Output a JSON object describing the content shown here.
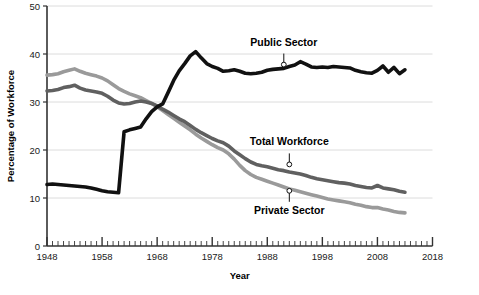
{
  "chart_data": {
    "type": "line",
    "title": "",
    "xlabel": "Year",
    "ylabel": "Percentage of Workforce",
    "xlim": [
      1948,
      2018
    ],
    "ylim": [
      0,
      50
    ],
    "xticks": [
      1948,
      1958,
      1968,
      1978,
      1988,
      1998,
      2008,
      2018
    ],
    "yticks": [
      0,
      10,
      20,
      30,
      40,
      50
    ],
    "xtick_labels": [
      "1948",
      "1958",
      "1968",
      "1978",
      "1988",
      "1998",
      "2008",
      "2018"
    ],
    "ytick_labels": [
      "0",
      "10",
      "20",
      "30",
      "40",
      "50"
    ],
    "minor_xtick_interval": 1,
    "grid": "horizontal",
    "grid_color": "#dcdcdc",
    "legend": "inline-annotations",
    "series": [
      {
        "name": "Public Sector",
        "color": "#111111",
        "label_position": "above",
        "label_anchor_x": 1991,
        "label_anchor_y": 37.8,
        "x": [
          1948,
          1949,
          1950,
          1951,
          1952,
          1953,
          1954,
          1955,
          1956,
          1957,
          1958,
          1959,
          1960,
          1961,
          1962,
          1963,
          1964,
          1965,
          1966,
          1967,
          1968,
          1969,
          1970,
          1971,
          1972,
          1973,
          1974,
          1975,
          1976,
          1977,
          1978,
          1979,
          1980,
          1981,
          1982,
          1983,
          1984,
          1985,
          1986,
          1987,
          1988,
          1989,
          1990,
          1991,
          1992,
          1993,
          1994,
          1995,
          1996,
          1997,
          1998,
          1999,
          2000,
          2001,
          2002,
          2003,
          2004,
          2005,
          2006,
          2007,
          2008,
          2009,
          2010,
          2011,
          2012,
          2013
        ],
        "values": [
          12.8,
          12.9,
          12.8,
          12.7,
          12.6,
          12.5,
          12.4,
          12.3,
          12.1,
          11.8,
          11.5,
          11.3,
          11.2,
          11.1,
          23.8,
          24.2,
          24.5,
          24.8,
          26.5,
          28.0,
          29.0,
          29.6,
          32.0,
          34.5,
          36.5,
          38.0,
          39.6,
          40.5,
          39.2,
          38.0,
          37.4,
          37.0,
          36.4,
          36.5,
          36.7,
          36.4,
          36.0,
          35.9,
          36.0,
          36.2,
          36.6,
          36.8,
          36.9,
          37.0,
          37.4,
          37.7,
          38.4,
          37.9,
          37.3,
          37.2,
          37.3,
          37.2,
          37.4,
          37.3,
          37.2,
          37.1,
          36.6,
          36.3,
          36.1,
          36.0,
          36.6,
          37.5,
          36.2,
          37.2,
          35.9,
          36.7
        ]
      },
      {
        "name": "Total Workforce",
        "color": "#606060",
        "label_position": "above",
        "label_anchor_x": 1992,
        "label_anchor_y": 17.0,
        "x": [
          1948,
          1949,
          1950,
          1951,
          1952,
          1953,
          1954,
          1955,
          1956,
          1957,
          1958,
          1959,
          1960,
          1961,
          1962,
          1963,
          1964,
          1965,
          1966,
          1967,
          1968,
          1969,
          1970,
          1971,
          1972,
          1973,
          1974,
          1975,
          1976,
          1977,
          1978,
          1979,
          1980,
          1981,
          1982,
          1983,
          1984,
          1985,
          1986,
          1987,
          1988,
          1989,
          1990,
          1991,
          1992,
          1993,
          1994,
          1995,
          1996,
          1997,
          1998,
          1999,
          2000,
          2001,
          2002,
          2003,
          2004,
          2005,
          2006,
          2007,
          2008,
          2009,
          2010,
          2011,
          2012,
          2013
        ],
        "values": [
          32.3,
          32.4,
          32.6,
          33.0,
          33.2,
          33.5,
          32.9,
          32.5,
          32.3,
          32.1,
          31.8,
          31.2,
          30.4,
          29.8,
          29.6,
          29.7,
          30.0,
          30.2,
          30.0,
          29.7,
          29.2,
          28.5,
          27.9,
          27.2,
          26.5,
          25.9,
          25.1,
          24.3,
          23.6,
          23.0,
          22.4,
          21.9,
          21.5,
          20.8,
          19.8,
          19.0,
          18.2,
          17.5,
          17.0,
          16.7,
          16.5,
          16.2,
          15.9,
          15.7,
          15.4,
          15.2,
          15.0,
          14.7,
          14.3,
          14.0,
          13.8,
          13.6,
          13.4,
          13.2,
          13.1,
          12.9,
          12.6,
          12.4,
          12.2,
          12.1,
          12.6,
          12.1,
          11.9,
          11.7,
          11.4,
          11.2
        ]
      },
      {
        "name": "Private Sector",
        "color": "#9a9a9a",
        "label_position": "below",
        "label_anchor_x": 1992,
        "label_anchor_y": 11.5,
        "x": [
          1948,
          1949,
          1950,
          1951,
          1952,
          1953,
          1954,
          1955,
          1956,
          1957,
          1958,
          1959,
          1960,
          1961,
          1962,
          1963,
          1964,
          1965,
          1966,
          1967,
          1968,
          1969,
          1970,
          1971,
          1972,
          1973,
          1974,
          1975,
          1976,
          1977,
          1978,
          1979,
          1980,
          1981,
          1982,
          1983,
          1984,
          1985,
          1986,
          1987,
          1988,
          1989,
          1990,
          1991,
          1992,
          1993,
          1994,
          1995,
          1996,
          1997,
          1998,
          1999,
          2000,
          2001,
          2002,
          2003,
          2004,
          2005,
          2006,
          2007,
          2008,
          2009,
          2010,
          2011,
          2012,
          2013
        ],
        "values": [
          35.6,
          35.7,
          35.9,
          36.3,
          36.6,
          36.9,
          36.4,
          36.0,
          35.7,
          35.4,
          35.0,
          34.4,
          33.6,
          32.8,
          32.2,
          31.7,
          31.3,
          30.9,
          30.3,
          29.7,
          29.0,
          28.2,
          27.4,
          26.6,
          25.8,
          25.0,
          24.2,
          23.3,
          22.5,
          21.8,
          21.1,
          20.5,
          20.0,
          19.2,
          18.1,
          16.8,
          15.7,
          14.9,
          14.3,
          13.9,
          13.5,
          13.1,
          12.7,
          12.3,
          11.9,
          11.6,
          11.3,
          11.0,
          10.7,
          10.4,
          10.1,
          9.8,
          9.6,
          9.4,
          9.2,
          9.0,
          8.7,
          8.5,
          8.2,
          8.0,
          8.0,
          7.7,
          7.5,
          7.2,
          7.0,
          6.9
        ]
      }
    ]
  }
}
